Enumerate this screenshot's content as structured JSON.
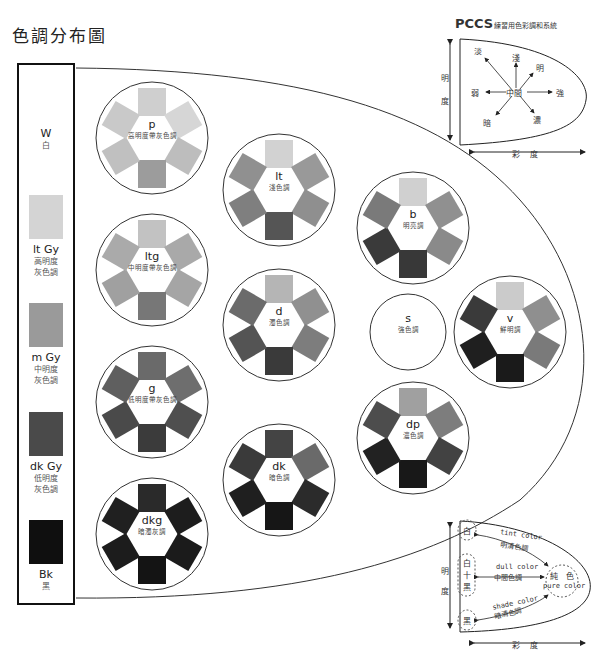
{
  "title": "色調分布圖",
  "gray_scale": [
    {
      "code": "W",
      "name": "白",
      "color": null
    },
    {
      "code": "lt Gy",
      "name_lines": [
        "高明度",
        "灰色調"
      ],
      "color": "#d4d4d4"
    },
    {
      "code": "m Gy",
      "name_lines": [
        "中明度",
        "灰色調"
      ],
      "color": "#9a9a9a"
    },
    {
      "code": "dk Gy",
      "name_lines": [
        "低明度",
        "灰色調"
      ],
      "color": "#4a4a4a"
    },
    {
      "code": "Bk",
      "name": "黑",
      "color": "#0f0f0f"
    }
  ],
  "tones": [
    {
      "code": "p",
      "name": "高明度帶灰色調",
      "swatches": [
        "#cfcfcf",
        "#d6d6d6",
        "#bdbdbd",
        "#9c9c9c",
        "#c0c0c0",
        "#c9c9c9"
      ]
    },
    {
      "code": "ltg",
      "name": "中明度帶灰色調",
      "swatches": [
        "#c2c2c2",
        "#a9a9a9",
        "#a5a5a5",
        "#777777",
        "#a0a0a0",
        "#aaaaaa"
      ]
    },
    {
      "code": "g",
      "name": "低明度帶灰色調",
      "swatches": [
        "#6a6a6a",
        "#6e6e6e",
        "#4f4f4f",
        "#3b3b3b",
        "#4a4a4a",
        "#5f5f5f"
      ]
    },
    {
      "code": "dkg",
      "name": "暗濁灰調",
      "swatches": [
        "#2a2a2a",
        "#1d1d1d",
        "#1b1b1b",
        "#141414",
        "#1c1c1c",
        "#202020"
      ]
    },
    {
      "code": "lt",
      "name": "淺色調",
      "swatches": [
        "#d2d2d2",
        "#999999",
        "#8f8f8f",
        "#555555",
        "#7f7f7f",
        "#909090"
      ]
    },
    {
      "code": "d",
      "name": "濁色調",
      "swatches": [
        "#b5b5b5",
        "#909090",
        "#7d7d7d",
        "#3a3a3a",
        "#545454",
        "#6b6b6b"
      ]
    },
    {
      "code": "dk",
      "name": "暗色調",
      "swatches": [
        "#444444",
        "#6a6a6a",
        "#2b2b2b",
        "#161616",
        "#1f1f1f",
        "#3a3a3a"
      ]
    },
    {
      "code": "b",
      "name": "明亮調",
      "swatches": [
        "#d0d0d0",
        "#909090",
        "#8a8a8a",
        "#383838",
        "#3a3a3a",
        "#7a7a7a"
      ]
    },
    {
      "code": "s",
      "name": "強色調",
      "swatches": []
    },
    {
      "code": "dp",
      "name": "濃色調",
      "swatches": [
        "#a0a0a0",
        "#7d7d7d",
        "#424242",
        "#181818",
        "#222222",
        "#4d4d4d"
      ]
    },
    {
      "code": "v",
      "name": "鮮明調",
      "swatches": [
        "#cbcbcb",
        "#8f8f8f",
        "#7a7a7a",
        "#1a1a1a",
        "#1f1f1f",
        "#3a3a3a"
      ]
    }
  ],
  "pccs_diagram": {
    "title_main": "PCCS",
    "title_sub": "練習用色彩調和系統",
    "axis_lightness": [
      "明",
      "度"
    ],
    "axis_chroma": [
      "彩",
      "度"
    ],
    "center": "中間",
    "directions": [
      "淡",
      "淺",
      "明",
      "強",
      "濃",
      "暗",
      "弱"
    ]
  },
  "tone_concept_diagram": {
    "axis_lightness": [
      "明",
      "度"
    ],
    "axis_chroma": [
      "彩",
      "度"
    ],
    "white": "白",
    "white_black": [
      "白",
      "十",
      "黑"
    ],
    "black": "黑",
    "pure": "純　色",
    "pure_en": "pure color",
    "tint_en": "tint color",
    "tint_zh": "明清色調",
    "dull_en": "dull color",
    "dull_zh": "中間色調",
    "shade_en": "shade color",
    "shade_zh": "暗清色調"
  }
}
